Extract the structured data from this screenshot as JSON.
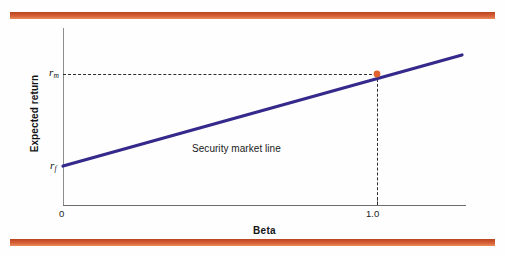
{
  "figure": {
    "background": "#fefefe",
    "width": 505,
    "height": 256,
    "rule_color": "#c9502a"
  },
  "chart_data": {
    "type": "line",
    "title": "",
    "subtitle": "",
    "xlabel": "Beta",
    "ylabel": "Expected return",
    "grid": false,
    "legend_position": "none",
    "xlim": [
      0,
      1.26
    ],
    "ylim": [
      0,
      1
    ],
    "x_ticks": [
      "0",
      "1.0"
    ],
    "x_tick_values": [
      0,
      1.0
    ],
    "y_ticks": [
      "r_f",
      "r_m"
    ],
    "y_tick_labels": {
      "risk_free": {
        "symbol": "r",
        "subscript": "f"
      },
      "market": {
        "symbol": "r",
        "subscript": "m"
      }
    },
    "series": [
      {
        "name": "Security market line",
        "color": "#35298c",
        "x": [
          0,
          1.0,
          1.26
        ],
        "y_pixel": [
          166,
          74,
          55
        ],
        "label": "Security market line"
      }
    ],
    "markers": [
      {
        "name": "market-portfolio",
        "x": 1.0,
        "y_label": "r_m",
        "color": "#e0622c"
      }
    ],
    "guide_lines": [
      {
        "name": "horizontal-dashed-to-rm",
        "orientation": "horizontal",
        "from": "y-axis",
        "to": "market-portfolio"
      },
      {
        "name": "vertical-dashed-to-beta-one",
        "orientation": "vertical",
        "from": "market-portfolio",
        "to": "x-axis"
      }
    ],
    "annotations": [
      {
        "name": "sml-annotation",
        "text": "Security market line"
      }
    ]
  },
  "axes": {
    "x_title": "Beta",
    "y_title": "Expected return",
    "x_tick_zero": "0",
    "x_tick_one": "1.0",
    "y_rate_market_symbol": "r",
    "y_rate_market_sub": "m",
    "y_rate_free_symbol": "r",
    "y_rate_free_sub": "f"
  },
  "annotation": {
    "sml_text": "Security market line"
  }
}
